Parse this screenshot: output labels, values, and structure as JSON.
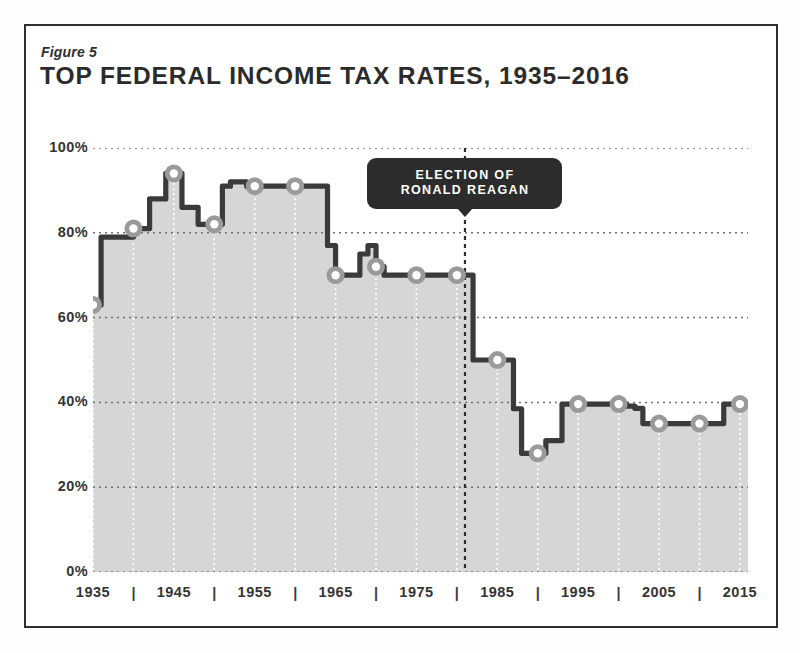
{
  "figure": {
    "label": "Figure 5",
    "title": "TOP FEDERAL INCOME TAX RATES, 1935–2016"
  },
  "colors": {
    "plot_fill": "#d6d6d6",
    "line": "#3a3a3a",
    "marker_fill": "#ffffff",
    "marker_ring": "#9a9a9a",
    "grid_horizontal": "#6f6f6f",
    "grid_vertical": "#ffffff",
    "frame": "#2e2e2e",
    "callout_bg": "#2c2c2c",
    "callout_text": "#ffffff",
    "text": "#343434"
  },
  "annotation": {
    "line1": "ELECTION OF",
    "line2": "RONALD REAGAN",
    "year": 1981
  },
  "chart_data": {
    "type": "line",
    "title": "TOP FEDERAL INCOME TAX RATES, 1935–2016",
    "subtitle": "Figure 5",
    "xlabel": "",
    "ylabel": "",
    "xlim": [
      1935,
      2016
    ],
    "ylim": [
      0,
      100
    ],
    "grid": true,
    "legend": "none",
    "y_ticks": [
      0,
      20,
      40,
      60,
      80,
      100
    ],
    "y_tick_labels": [
      "0%",
      "20%",
      "40%",
      "60%",
      "80%",
      "100%"
    ],
    "x_ticks": [
      1935,
      1940,
      1945,
      1950,
      1955,
      1960,
      1965,
      1970,
      1975,
      1980,
      1985,
      1990,
      1995,
      2000,
      2005,
      2010,
      2015
    ],
    "x_tick_labels": [
      "1935",
      "|",
      "1945",
      "|",
      "1955",
      "|",
      "1965",
      "|",
      "1975",
      "|",
      "1985",
      "|",
      "1995",
      "|",
      "2005",
      "|",
      "2015"
    ],
    "x_labeled_years": [
      1935,
      1945,
      1955,
      1965,
      1975,
      1985,
      1995,
      2005,
      2015
    ],
    "x_bar_years": [
      1940,
      1950,
      1960,
      1970,
      1980,
      1990,
      2000,
      2010
    ],
    "marker_years": [
      1935,
      1940,
      1945,
      1950,
      1955,
      1960,
      1965,
      1970,
      1975,
      1980,
      1985,
      1990,
      1995,
      2000,
      2005,
      2010,
      2015
    ],
    "series": [
      {
        "name": "Top federal income tax rate",
        "x": [
          1935,
          1936,
          1937,
          1938,
          1939,
          1940,
          1941,
          1942,
          1943,
          1944,
          1945,
          1946,
          1947,
          1948,
          1949,
          1950,
          1951,
          1952,
          1953,
          1954,
          1955,
          1956,
          1957,
          1958,
          1959,
          1960,
          1961,
          1962,
          1963,
          1964,
          1965,
          1966,
          1967,
          1968,
          1969,
          1970,
          1971,
          1972,
          1973,
          1974,
          1975,
          1976,
          1977,
          1978,
          1979,
          1980,
          1981,
          1982,
          1983,
          1984,
          1985,
          1986,
          1987,
          1988,
          1989,
          1990,
          1991,
          1992,
          1993,
          1994,
          1995,
          1996,
          1997,
          1998,
          1999,
          2000,
          2001,
          2002,
          2003,
          2004,
          2005,
          2006,
          2007,
          2008,
          2009,
          2010,
          2011,
          2012,
          2013,
          2014,
          2015,
          2016
        ],
        "y": [
          63,
          79,
          79,
          79,
          79,
          81,
          81,
          88,
          88,
          94,
          94,
          86,
          86,
          82,
          82,
          82,
          91,
          92,
          92,
          91,
          91,
          91,
          91,
          91,
          91,
          91,
          91,
          91,
          91,
          77,
          70,
          70,
          70,
          75,
          77,
          72,
          70,
          70,
          70,
          70,
          70,
          70,
          70,
          70,
          70,
          70,
          70,
          50,
          50,
          50,
          50,
          50,
          38.5,
          28,
          28,
          28,
          31,
          31,
          39.6,
          39.6,
          39.6,
          39.6,
          39.6,
          39.6,
          39.6,
          39.6,
          39.1,
          38.6,
          35,
          35,
          35,
          35,
          35,
          35,
          35,
          35,
          35,
          35,
          39.6,
          39.6,
          39.6,
          39.6
        ]
      }
    ],
    "annotations": [
      {
        "text": "ELECTION OF RONALD REAGAN",
        "x": 1981,
        "type": "vertical-dashed-line-with-label"
      }
    ]
  }
}
